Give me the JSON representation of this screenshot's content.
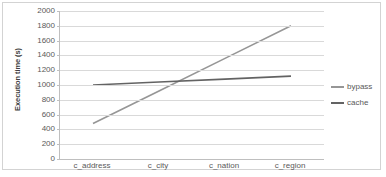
{
  "chart_data": {
    "type": "line",
    "title": "",
    "xlabel": "",
    "ylabel": "Execution time (s)",
    "categories": [
      "c_address",
      "c_city",
      "c_nation",
      "c_region"
    ],
    "series": [
      {
        "name": "bypass",
        "color": "#969696",
        "values": [
          480,
          920,
          1360,
          1800
        ]
      },
      {
        "name": "cache",
        "color": "#636363",
        "values": [
          1000,
          1040,
          1080,
          1120
        ]
      }
    ],
    "ylim": [
      0,
      2000
    ],
    "yticks": [
      2000,
      1800,
      1600,
      1400,
      1200,
      1000,
      800,
      600,
      400,
      200,
      0
    ],
    "grid": "horizontal",
    "legend_position": "right"
  },
  "colors": {
    "frame": "#d3d3d3",
    "gridline": "#d9d9d9",
    "axis": "#bfbfbf",
    "tick_text": "#595959",
    "axis_title": "#404040",
    "background": "#ffffff"
  }
}
